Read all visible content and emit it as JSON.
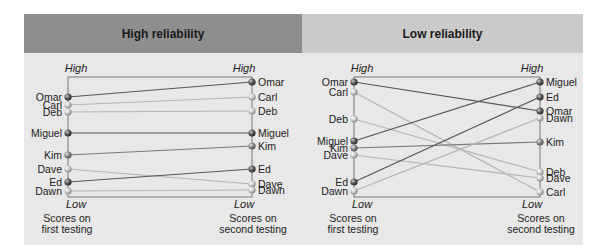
{
  "chart_data": [
    {
      "type": "slope",
      "title": "High reliability",
      "left_axis": {
        "top_label": "High",
        "bottom_label": "Low",
        "caption": [
          "Scores on",
          "first testing"
        ]
      },
      "right_axis": {
        "top_label": "High",
        "bottom_label": "Low",
        "caption": [
          "Scores on",
          "second testing"
        ]
      },
      "people": [
        {
          "name": "Omar",
          "first_y": 97,
          "second_y": 82,
          "tone": "dark"
        },
        {
          "name": "Carl",
          "first_y": 105,
          "second_y": 97,
          "tone": "light"
        },
        {
          "name": "Deb",
          "first_y": 112,
          "second_y": 111,
          "tone": "light"
        },
        {
          "name": "Miguel",
          "first_y": 133,
          "second_y": 133,
          "tone": "dark"
        },
        {
          "name": "Kim",
          "first_y": 155,
          "second_y": 146,
          "tone": "mid"
        },
        {
          "name": "Dave",
          "first_y": 169,
          "second_y": 184,
          "tone": "light"
        },
        {
          "name": "Ed",
          "first_y": 182,
          "second_y": 169,
          "tone": "dark"
        },
        {
          "name": "Dawn",
          "first_y": 191,
          "second_y": 190,
          "tone": "light"
        }
      ]
    },
    {
      "type": "slope",
      "title": "Low reliability",
      "left_axis": {
        "top_label": "High",
        "bottom_label": "Low",
        "caption": [
          "Scores on",
          "first testing"
        ]
      },
      "right_axis": {
        "top_label": "High",
        "bottom_label": "Low",
        "caption": [
          "Scores on",
          "second testing"
        ]
      },
      "people": [
        {
          "name": "Omar",
          "first_y": 82,
          "second_y": 111,
          "tone": "dark"
        },
        {
          "name": "Carl",
          "first_y": 92,
          "second_y": 192,
          "tone": "light"
        },
        {
          "name": "Deb",
          "first_y": 119,
          "second_y": 172,
          "tone": "light"
        },
        {
          "name": "Miguel",
          "first_y": 141,
          "second_y": 82,
          "tone": "dark"
        },
        {
          "name": "Kim",
          "first_y": 148,
          "second_y": 142,
          "tone": "mid"
        },
        {
          "name": "Dave",
          "first_y": 155,
          "second_y": 178,
          "tone": "light"
        },
        {
          "name": "Ed",
          "first_y": 182,
          "second_y": 97,
          "tone": "dark"
        },
        {
          "name": "Dawn",
          "first_y": 191,
          "second_y": 118,
          "tone": "light"
        }
      ]
    }
  ],
  "panels": {
    "high": {
      "title": "High reliability"
    },
    "low": {
      "title": "Low reliability"
    }
  },
  "colors": {
    "dark": "#555555",
    "mid": "#7a7a7a",
    "light": "#b4b4b4",
    "axis": "#8a8a8a",
    "header_high": "#8e8e8e",
    "header_low": "#cacaca",
    "panel_bg": "#e8e8e8"
  }
}
